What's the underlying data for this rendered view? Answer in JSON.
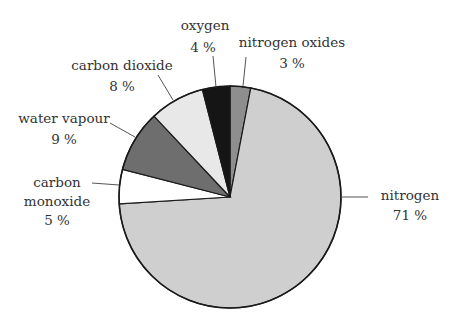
{
  "chart_data": {
    "type": "pie",
    "title": "",
    "start_angle_deg": 0,
    "direction": "clockwise",
    "slices": [
      {
        "label": "nitrogen oxides",
        "value": 3,
        "pct_label": "3 %",
        "color": "#8e8e8e"
      },
      {
        "label": "nitrogen",
        "value": 71,
        "pct_label": "71 %",
        "color": "#cfcfcf"
      },
      {
        "label": "carbon monoxide",
        "value": 5,
        "pct_label": "5 %",
        "color": "#ffffff"
      },
      {
        "label": "water vapour",
        "value": 9,
        "pct_label": "9 %",
        "color": "#6e6e6e"
      },
      {
        "label": "carbon dioxide",
        "value": 8,
        "pct_label": "8 %",
        "color": "#e8e8e8"
      },
      {
        "label": "oxygen",
        "value": 4,
        "pct_label": "4 %",
        "color": "#151515"
      }
    ],
    "legend": "none (callout labels with leader lines)"
  },
  "labels": {
    "nitrogen_oxides": {
      "name": "nitrogen oxides",
      "pct": "3 %"
    },
    "nitrogen": {
      "name": "nitrogen",
      "pct": "71 %"
    },
    "carbon_monoxide": {
      "name1": "carbon",
      "name2": "monoxide",
      "pct": "5 %"
    },
    "water_vapour": {
      "name": "water vapour",
      "pct": "9 %"
    },
    "carbon_dioxide": {
      "name": "carbon dioxide",
      "pct": "8 %"
    },
    "oxygen": {
      "name": "oxygen",
      "pct": "4 %"
    }
  }
}
